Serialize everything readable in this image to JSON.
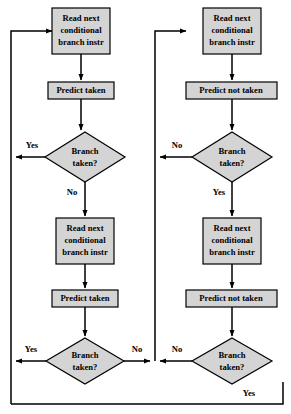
{
  "diagram": {
    "style": {
      "node_fill": "#d4d4d4",
      "node_stroke": "#000000",
      "line_color": "#000000",
      "background": "#ffffff"
    },
    "nodes": {
      "left_stage1_read": "Read next conditional branch instr",
      "left_stage1_read_lines": [
        "Read next",
        "conditional",
        "branch instr"
      ],
      "left_stage1_predict": "Predict taken",
      "left_stage1_decision_lines": [
        "Branch",
        "taken?"
      ],
      "left_stage2_read_lines": [
        "Read next",
        "conditional",
        "branch instr"
      ],
      "left_stage2_predict": "Predict taken",
      "left_stage2_decision_lines": [
        "Branch",
        "taken?"
      ],
      "right_stage1_read_lines": [
        "Read next",
        "conditional",
        "branch instr"
      ],
      "right_stage1_predict": "Predict not taken",
      "right_stage1_decision_lines": [
        "Branch",
        "taken?"
      ],
      "right_stage2_read_lines": [
        "Read next",
        "conditional",
        "branch instr"
      ],
      "right_stage2_predict": "Predict not taken",
      "right_stage2_decision_lines": [
        "Branch",
        "taken?"
      ]
    },
    "edge_labels": {
      "left_stage1_yes": "Yes",
      "left_stage1_no": "No",
      "left_stage2_yes": "Yes",
      "left_stage2_no": "No",
      "right_stage1_no": "No",
      "right_stage1_yes": "Yes",
      "right_stage2_no": "No",
      "right_stage2_yes": "Yes"
    }
  }
}
